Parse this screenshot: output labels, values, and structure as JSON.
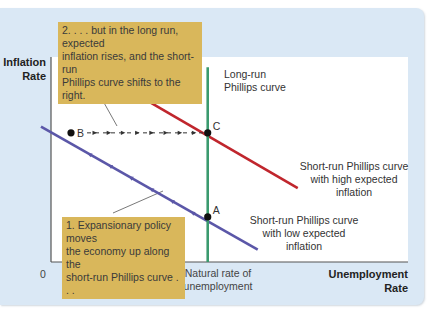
{
  "chart_data": {
    "type": "line",
    "title": "",
    "xlabel": "Unemployment Rate",
    "ylabel": "Inflation Rate",
    "x_axis": {
      "label_line1": "Unemployment",
      "label_line2": "Rate",
      "origin_label": "0",
      "tick_labels": [
        "Natural rate of unemployment"
      ]
    },
    "y_axis": {
      "label_line1": "Inflation",
      "label_line2": "Rate"
    },
    "xlim": [
      0,
      10
    ],
    "ylim": [
      0,
      10
    ],
    "grid": false,
    "natural_rate_x": 4.7,
    "series": [
      {
        "name": "Long-run Phillips curve",
        "kind": "vertical",
        "color": "#3a9a6e",
        "x": 4.7,
        "y_range": [
          0,
          9.5
        ],
        "label_line1": "Long-run",
        "label_line2": "Phillips curve"
      },
      {
        "name": "Short-run Phillips curve with high expected inflation",
        "kind": "line",
        "color": "#c0262d",
        "points": [
          [
            1.8,
            8.9
          ],
          [
            7.4,
            3.6
          ]
        ],
        "label_lines": [
          "Short-run Phillips curve",
          "with high expected",
          "inflation"
        ]
      },
      {
        "name": "Short-run Phillips curve with low expected inflation",
        "kind": "line",
        "color": "#5b57a8",
        "points": [
          [
            -0.3,
            6.6
          ],
          [
            6.2,
            0.6
          ]
        ],
        "label_lines": [
          "Short-run Phillips curve",
          "with low expected",
          "inflation"
        ],
        "arrow_direction": "up-left"
      }
    ],
    "points": [
      {
        "label": "A",
        "x": 4.7,
        "y": 2.2
      },
      {
        "label": "B",
        "x": 0.6,
        "y": 6.3
      },
      {
        "label": "C",
        "x": 4.7,
        "y": 6.3
      }
    ],
    "movement": {
      "from": "B",
      "to": "C",
      "style": "dashed-arrows"
    },
    "annotations": [
      {
        "id": "note-1",
        "lines": [
          "1. Expansionary policy moves",
          "the economy up along the",
          "short-run Phillips curve . . ."
        ],
        "color": "#d9b75b"
      },
      {
        "id": "note-2",
        "lines": [
          "2. . . . but in the long run, expected",
          "inflation rises, and the short-run",
          "Phillips curve shifts to the right."
        ],
        "color": "#d9b75b"
      }
    ]
  }
}
